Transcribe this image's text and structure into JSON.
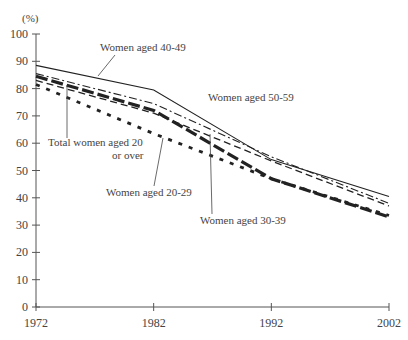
{
  "chart_data": {
    "type": "line",
    "title": "",
    "ylabel": "(%)",
    "xlabel": "",
    "x": [
      1972,
      1982,
      1992,
      2002
    ],
    "xticks": [
      "1972",
      "1982",
      "1992",
      "2002"
    ],
    "yticks": [
      "0",
      "10",
      "20",
      "30",
      "40",
      "50",
      "60",
      "70",
      "80",
      "90",
      "100"
    ],
    "ylim": [
      0,
      100
    ],
    "grid": false,
    "legend": "none (inline annotations)",
    "series": [
      {
        "name": "Women aged 50-59",
        "style": "solid",
        "values": [
          88.5,
          79.5,
          54,
          40.5
        ]
      },
      {
        "name": "Women aged 40-49",
        "style": "dash-dot",
        "values": [
          85.5,
          74.5,
          55,
          38
        ]
      },
      {
        "name": "Women aged 30-39",
        "style": "thick-dash",
        "values": [
          84.5,
          72,
          47,
          33
        ]
      },
      {
        "name": "Total women aged 20 or over",
        "style": "dashed",
        "values": [
          83,
          71,
          53.5,
          37
        ]
      },
      {
        "name": "Women aged 20-29",
        "style": "dotted",
        "values": [
          81.5,
          63.5,
          47,
          33.5
        ]
      }
    ],
    "annotations": [
      {
        "text": "Women aged 40-49"
      },
      {
        "text": "Women aged 50-59"
      },
      {
        "text": "Total women aged 20"
      },
      {
        "text": "or over"
      },
      {
        "text": "Women aged 20-29"
      },
      {
        "text": "Women aged 30-39"
      }
    ]
  }
}
